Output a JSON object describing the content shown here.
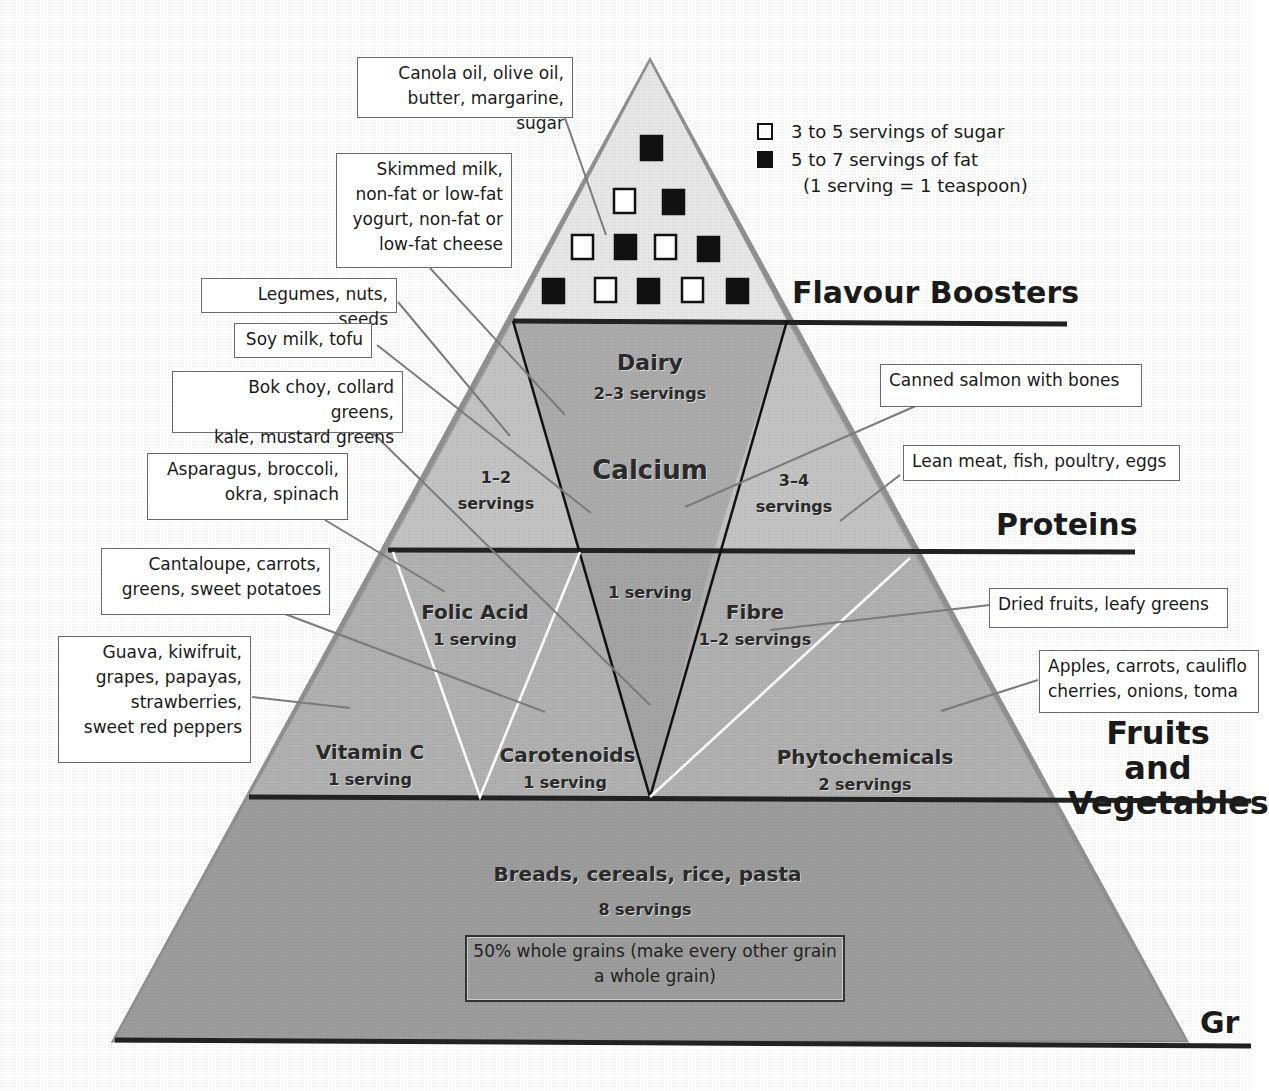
{
  "legend": {
    "sugar": "3 to 5 servings of sugar",
    "fat": "5 to 7 servings of fat",
    "note": "(1 serving = 1 teaspoon)"
  },
  "tiers": {
    "flavour": "Flavour Boosters",
    "proteins": "Proteins",
    "fruits_veg": "Fruits and\nVegetables",
    "grains": "Gr"
  },
  "inside": {
    "dairy_title": "Dairy",
    "dairy_servings": "2–3 servings",
    "calcium": "Calcium",
    "left_servings": "1–2\nservings",
    "right_servings": "3–4\nservings",
    "center_servings": "1 serving",
    "folic_title": "Folic Acid",
    "folic_servings": "1 serving",
    "fibre_title": "Fibre",
    "fibre_servings": "1–2 servings",
    "vitc_title": "Vitamin C",
    "vitc_servings": "1 serving",
    "carot_title": "Carotenoids",
    "carot_servings": "1 serving",
    "phyto_title": "Phytochemicals",
    "phyto_servings": "2 servings",
    "grains_title": "Breads, cereals, rice, pasta",
    "grains_servings": "8 servings",
    "grains_box": "50% whole grains\n(make every other grain a whole grain)"
  },
  "callouts": {
    "oils": "Canola oil, olive oil,\nbutter, margarine, sugar",
    "dairy": "Skimmed milk,\nnon-fat or low-fat\nyogurt, non-fat or\nlow-fat cheese",
    "legumes": "Legumes, nuts, seeds",
    "soy": "Soy milk, tofu",
    "bokchoy": "Bok choy, collard greens,\nkale, mustard greens",
    "asparagus": "Asparagus, broccoli,\nokra, spinach",
    "cantaloupe": "Cantaloupe, carrots,\ngreens, sweet potatoes",
    "guava": "Guava, kiwifruit,\ngrapes, papayas,\nstrawberries,\nsweet red peppers",
    "salmon": "Canned salmon with bones",
    "leanmeat": "Lean meat, fish, poultry, eggs",
    "dried": "Dried fruits, leafy greens",
    "apples": "Apples, carrots, cauliflo\ncherries, onions, toma"
  }
}
